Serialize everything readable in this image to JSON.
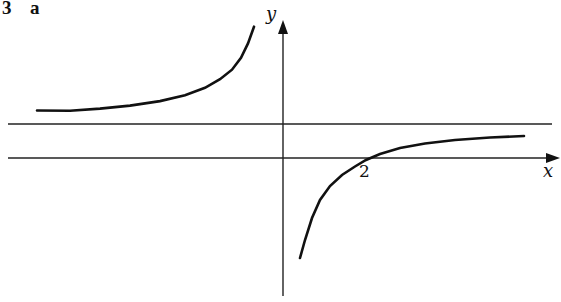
{
  "header": {
    "question_number": "3",
    "part_label": "a"
  },
  "axes": {
    "x_label": "x",
    "y_label": "y"
  },
  "annotations": {
    "x_intercept_label": "2"
  },
  "colors": {
    "ink": "#111111",
    "background": "#ffffff"
  },
  "graph": {
    "description": "Rectangular hyperbola with vertical asymptote x = 0 (the y-axis) and a horizontal asymptote above the x-axis; right branch crosses x-axis at x = 2",
    "vertical_asymptote": "x = 0",
    "horizontal_asymptote": "horizontal line above x-axis",
    "x_intercept": 2
  }
}
